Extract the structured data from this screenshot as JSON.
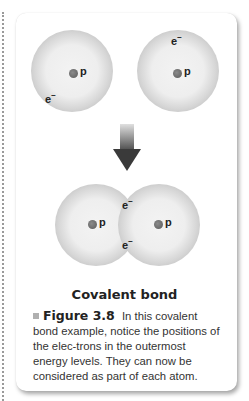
{
  "figure": {
    "top_atoms": [
      {
        "nucleus_label": "p",
        "electron_label": "e",
        "electron_charge": "−"
      },
      {
        "nucleus_label": "p",
        "electron_label": "e",
        "electron_charge": "−"
      }
    ],
    "bonded_molecule": {
      "nucleus_labels": [
        "p",
        "p"
      ],
      "shared_electrons": [
        {
          "label": "e",
          "charge": "−"
        },
        {
          "label": "e",
          "charge": "−"
        }
      ]
    },
    "title": "Covalent bond",
    "caption": {
      "figure_number": "Figure 3.8",
      "text": "In this covalent bond example, notice the positions of the elec-trons in the outermost energy levels. They can now be considered as part of each atom."
    }
  }
}
